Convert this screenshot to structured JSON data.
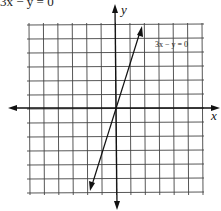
{
  "title": "3x − y = 0",
  "chart_data": {
    "type": "line",
    "title": "3x − y = 0",
    "xlabel": "x",
    "ylabel": "y",
    "equation": "3x − y = 0",
    "line_label": "3x − y = 0",
    "grid": true,
    "xlim": [
      -6,
      6
    ],
    "ylim": [
      -6,
      6
    ],
    "series": [
      {
        "name": "3x − y = 0",
        "x": [
          -2,
          0,
          2
        ],
        "y": [
          -6,
          0,
          6
        ]
      }
    ],
    "colors": {
      "grid": "#333333",
      "axis": "#111111",
      "line": "#111111"
    }
  }
}
